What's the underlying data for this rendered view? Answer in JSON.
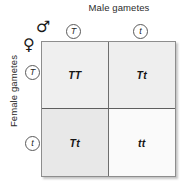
{
  "diagram": {
    "type": "punnett-square",
    "title_top": "Male gametes",
    "title_left": "Female gametes",
    "male_symbol": "♂",
    "female_symbol": "♀",
    "column_gametes": [
      "T",
      "t"
    ],
    "row_gametes": [
      "T",
      "t"
    ],
    "cells": [
      {
        "genotype": "TT",
        "row": 0,
        "col": 0,
        "fill": "#efefef"
      },
      {
        "genotype": "Tt",
        "row": 0,
        "col": 1,
        "fill": "#eeeeee"
      },
      {
        "genotype": "Tt",
        "row": 1,
        "col": 0,
        "fill": "#e8e8e8"
      },
      {
        "genotype": "tt",
        "row": 1,
        "col": 1,
        "fill": "#fafafa"
      }
    ],
    "colors": {
      "border": "#8d8d8d",
      "grid_line": "#6e6e6e",
      "text": "#1a1a1a"
    }
  }
}
